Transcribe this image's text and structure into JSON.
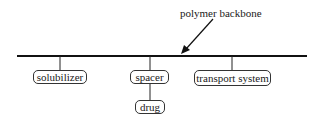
{
  "diagram": {
    "annotation": "polymer backbone",
    "nodes": {
      "solubilizer": "solubilizer",
      "spacer": "spacer",
      "drug": "drug",
      "transport": "transport system"
    },
    "edges": [
      {
        "from": "polymer backbone",
        "to": "solubilizer"
      },
      {
        "from": "polymer backbone",
        "to": "spacer"
      },
      {
        "from": "polymer backbone",
        "to": "transport system"
      },
      {
        "from": "spacer",
        "to": "drug"
      }
    ],
    "colors": {
      "line": "#111111",
      "text": "#1a1a1a",
      "background": "#ffffff"
    }
  }
}
